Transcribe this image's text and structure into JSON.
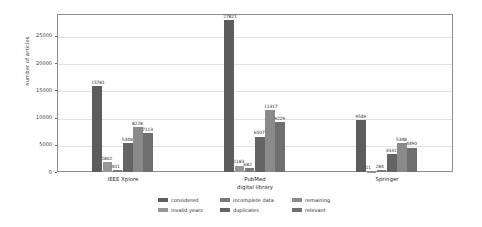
{
  "chart_data": {
    "type": "bar",
    "title": "",
    "xlabel": "",
    "ylabel": "number of articles",
    "ylim": [
      0,
      29000
    ],
    "yticks": [
      0,
      5000,
      10000,
      15000,
      20000,
      25000
    ],
    "ytick_labels": [
      "0",
      "5000",
      "10000",
      "15000",
      "20000",
      "25000"
    ],
    "grid": true,
    "legend_position": "bottom",
    "categories": [
      "IEEE Xplore",
      "PubMed\ndigital library",
      "Springer"
    ],
    "category_lines": [
      [
        "IEEE Xplore"
      ],
      [
        "PubMed",
        "digital library"
      ],
      [
        "Springer"
      ]
    ],
    "series": [
      {
        "name": "considered",
        "color": "#5d5d5d",
        "values": [
          15781,
          27821,
          9549
        ]
      },
      {
        "name": "invalid years",
        "color": "#969696",
        "values": [
          1802,
          1183,
          11
        ]
      },
      {
        "name": "incomplete data",
        "color": "#7a7a7a",
        "values": [
          401,
          682,
          284
        ]
      },
      {
        "name": "duplicates",
        "color": "#646464",
        "values": [
          5348,
          6507,
          3331
        ]
      },
      {
        "name": "remaining",
        "color": "#8a8a8a",
        "values": [
          8228,
          11317,
          5348
        ]
      },
      {
        "name": "relevant",
        "color": "#6f6f6f",
        "values": [
          7113,
          9229,
          4490
        ]
      }
    ],
    "value_labels": [
      [
        "15781",
        "1802",
        "401",
        "5348",
        "8228",
        "7113"
      ],
      [
        "27821",
        "1183",
        "682",
        "6507",
        "11317",
        "9229"
      ],
      [
        "9549",
        "11",
        "284",
        "3331",
        "5348",
        "4490"
      ]
    ]
  },
  "legend": {
    "entries": [
      {
        "label": "considered"
      },
      {
        "label": "incomplete data"
      },
      {
        "label": "remaining"
      },
      {
        "label": "invalid years"
      },
      {
        "label": "duplicates"
      },
      {
        "label": "relevant"
      }
    ]
  }
}
